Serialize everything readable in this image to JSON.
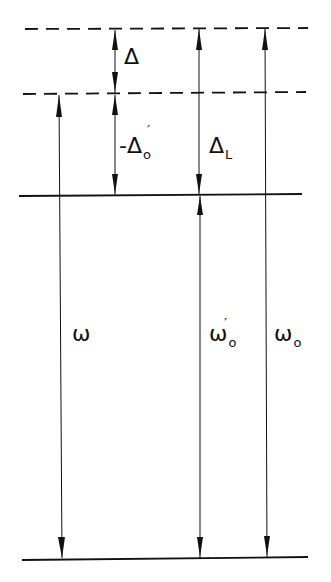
{
  "diagram": {
    "type": "energy-level-frequency-diagram",
    "levels": [
      {
        "id": "upper-dashed",
        "style": "dashed",
        "y": 29
      },
      {
        "id": "middle-dashed",
        "style": "dashed",
        "y": 94
      },
      {
        "id": "middle-solid",
        "style": "solid",
        "y": 195
      },
      {
        "id": "ground-solid",
        "style": "solid",
        "y": 558
      }
    ],
    "arrows": [
      {
        "id": "delta",
        "from": "upper-dashed",
        "to": "middle-dashed",
        "label": "Δ"
      },
      {
        "id": "neg-delta-prime-0",
        "from": "middle-dashed",
        "to": "middle-solid",
        "label": "-Δ'₀"
      },
      {
        "id": "omega",
        "from": "middle-dashed",
        "to": "ground-solid",
        "label": "ω"
      },
      {
        "id": "delta-L",
        "from": "upper-dashed",
        "to": "middle-solid",
        "label": "Δ_L"
      },
      {
        "id": "omega-prime-0",
        "from": "middle-solid",
        "to": "ground-solid",
        "label": "ω'₀"
      },
      {
        "id": "omega-0",
        "from": "upper-dashed",
        "to": "ground-solid",
        "label": "ω₀"
      }
    ]
  },
  "labels": {
    "delta": {
      "main": "Δ"
    },
    "neg_delta_prime_0": {
      "main": "-Δ",
      "prime": "′",
      "sub": "o"
    },
    "delta_L": {
      "main": "Δ",
      "sub": "L"
    },
    "omega": {
      "main": "ω"
    },
    "omega_prime_0": {
      "main": "ω",
      "prime": "′",
      "sub": "o"
    },
    "omega_0": {
      "main": "ω",
      "sub": "o"
    }
  },
  "colors": {
    "ink": "#111111",
    "background": "#ffffff"
  }
}
